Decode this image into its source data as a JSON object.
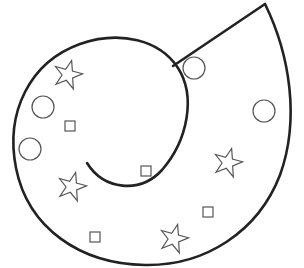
{
  "figure": {
    "colors": {
      "outline": "#222222",
      "shapes": "#555555",
      "background": "#ffffff"
    },
    "counts": {
      "stars": 5,
      "circles": 4,
      "squares": 5
    },
    "stars": [
      {
        "x": 68,
        "y": 74
      },
      {
        "x": 72,
        "y": 186
      },
      {
        "x": 228,
        "y": 162
      },
      {
        "x": 174,
        "y": 238
      }
    ],
    "circles": [
      {
        "x": 43,
        "y": 107,
        "r": 11
      },
      {
        "x": 30,
        "y": 149,
        "r": 11
      },
      {
        "x": 194,
        "y": 68,
        "r": 11
      },
      {
        "x": 264,
        "y": 111,
        "r": 11
      }
    ],
    "squares": [
      {
        "x": 70,
        "y": 126
      },
      {
        "x": 146,
        "y": 171
      },
      {
        "x": 208,
        "y": 212
      },
      {
        "x": 95,
        "y": 237
      }
    ]
  }
}
